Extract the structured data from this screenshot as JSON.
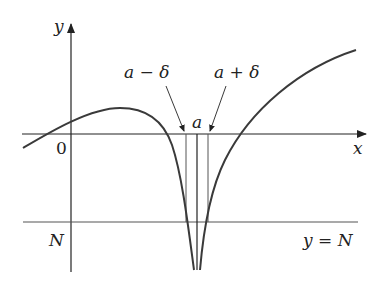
{
  "diagram": {
    "type": "limit-infinite-definition",
    "labels": {
      "y_axis": "y",
      "x_axis": "x",
      "origin": "0",
      "a_minus_delta": "a − δ",
      "a_plus_delta": "a + δ",
      "a": "a",
      "N_left": "N",
      "line_label": "y = N"
    },
    "colors": {
      "curve": "#3a3a3a",
      "axes": "#222222",
      "guides": "#555555"
    }
  }
}
